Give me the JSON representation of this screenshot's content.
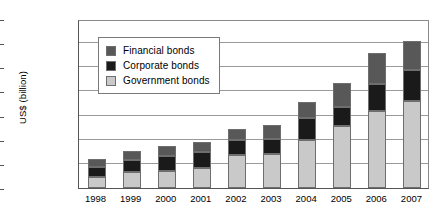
{
  "chart_data": {
    "type": "bar",
    "stacked": true,
    "title": "",
    "xlabel": "",
    "ylabel": "US$ (billion)",
    "ylim": [
      0,
      3500
    ],
    "ytick_step": 500,
    "ytick_labels": [
      "0",
      "500",
      "1,000",
      "1,500",
      "2,000",
      "2,500",
      "3,000",
      "3,500"
    ],
    "ytick_values": [
      0,
      500,
      1000,
      1500,
      2000,
      2500,
      3000,
      3500
    ],
    "grid": true,
    "legend_position": "upper-left-inside",
    "categories": [
      "1998",
      "1999",
      "2000",
      "2001",
      "2002",
      "2003",
      "2004",
      "2005",
      "2006",
      "2007"
    ],
    "series": [
      {
        "name": "Government bonds",
        "color": "#c9c9c9",
        "values": [
          230,
          330,
          350,
          415,
          685,
          700,
          1000,
          1290,
          1600,
          1800
        ]
      },
      {
        "name": "Corporate bonds",
        "color": "#1a1a1a",
        "values": [
          200,
          250,
          310,
          330,
          310,
          310,
          450,
          390,
          550,
          650
        ]
      },
      {
        "name": "Financial bonds",
        "color": "#585858",
        "values": [
          170,
          190,
          210,
          210,
          225,
          290,
          340,
          500,
          650,
          600
        ]
      }
    ],
    "totals": [
      600,
      770,
      870,
      955,
      1220,
      1300,
      1790,
      2180,
      2800,
      3050
    ],
    "legend_entries": [
      {
        "label": "Financial bonds",
        "color": "#585858"
      },
      {
        "label": "Corporate bonds",
        "color": "#1a1a1a"
      },
      {
        "label": "Government bonds",
        "color": "#c9c9c9"
      }
    ]
  },
  "colors": {
    "axis": "#555555",
    "gridline": "#9a9a9a",
    "background": "#ffffff",
    "bar_outline": "#6e6e6e"
  }
}
